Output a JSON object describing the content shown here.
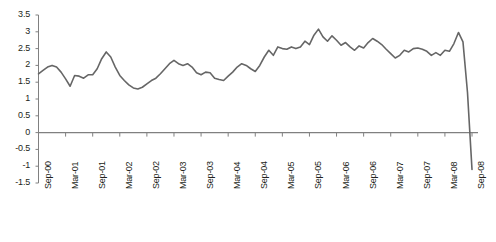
{
  "chart_data": {
    "type": "line",
    "title": "",
    "xlabel": "",
    "ylabel": "",
    "ylim": [
      -1.5,
      3.5
    ],
    "ytick_step": 0.5,
    "grid": false,
    "legend": null,
    "zero_line": true,
    "line_color": "#666666",
    "axis_color": "#808080",
    "text_color": "#231f20",
    "yticks": [
      "3.5",
      "3",
      "2.5",
      "2",
      "1.5",
      "1",
      "0.5",
      "0",
      "-0.5",
      "-1",
      "-1.5"
    ],
    "ytick_values": [
      3.5,
      3,
      2.5,
      2,
      1.5,
      1,
      0.5,
      0,
      -0.5,
      -1,
      -1.5
    ],
    "xticks": [
      "Sep-00",
      "Mar-01",
      "Sep-01",
      "Mar-02",
      "Sep-02",
      "Mar-03",
      "Sep-03",
      "Mar-04",
      "Sep-04",
      "Mar-05",
      "Sep-05",
      "Mar-06",
      "Sep-06",
      "Mar-07",
      "Sep-07",
      "Mar-08",
      "Sep-08"
    ],
    "x_start": "Sep-00",
    "x_end": "Sep-08",
    "x_interval_months": 1,
    "tick_interval_months": 6,
    "series": [
      {
        "name": "series-1",
        "values": [
          1.75,
          1.85,
          1.95,
          2.0,
          1.95,
          1.8,
          1.6,
          1.38,
          1.7,
          1.68,
          1.62,
          1.72,
          1.72,
          1.9,
          2.2,
          2.4,
          2.25,
          1.95,
          1.7,
          1.55,
          1.42,
          1.33,
          1.3,
          1.35,
          1.45,
          1.55,
          1.62,
          1.75,
          1.9,
          2.05,
          2.15,
          2.05,
          2.0,
          2.05,
          1.95,
          1.78,
          1.72,
          1.8,
          1.78,
          1.62,
          1.58,
          1.55,
          1.68,
          1.8,
          1.95,
          2.05,
          2.0,
          1.9,
          1.82,
          2.0,
          2.25,
          2.45,
          2.3,
          2.55,
          2.5,
          2.48,
          2.55,
          2.5,
          2.55,
          2.72,
          2.62,
          2.9,
          3.08,
          2.85,
          2.72,
          2.88,
          2.75,
          2.6,
          2.68,
          2.55,
          2.45,
          2.58,
          2.52,
          2.68,
          2.8,
          2.72,
          2.62,
          2.48,
          2.35,
          2.22,
          2.3,
          2.45,
          2.4,
          2.5,
          2.52,
          2.48,
          2.42,
          2.3,
          2.38,
          2.3,
          2.45,
          2.42,
          2.65,
          2.98,
          2.7,
          1.2,
          -1.1
        ]
      }
    ]
  }
}
